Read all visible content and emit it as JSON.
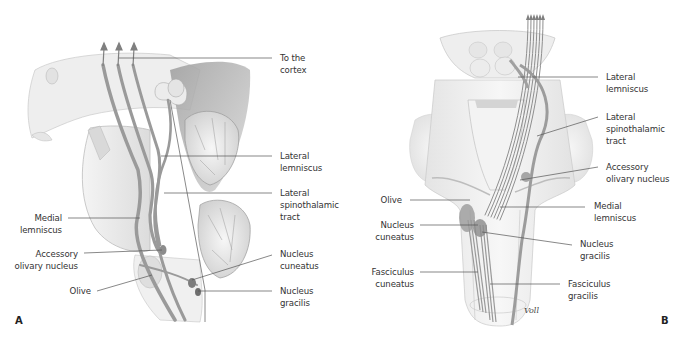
{
  "figure": {
    "panels": [
      {
        "id": "A",
        "letter": "A",
        "labels": {
          "to_cortex": "To the\ncortex",
          "lateral_lemniscus": "Lateral\nlemniscus",
          "lateral_spinothalamic": "Lateral\nspinothalamic\ntract",
          "medial_lemniscus": "Medial\nlemniscus",
          "accessory_olivary": "Accessory\nolivary nucleus",
          "olive": "Olive",
          "nucleus_cuneatus": "Nucleus\ncuneatus",
          "nucleus_gracilis": "Nucleus\ngracilis"
        }
      },
      {
        "id": "B",
        "letter": "B",
        "signature": "Voll",
        "labels": {
          "lateral_lemniscus": "Lateral\nlemniscus",
          "lateral_spinothalamic": "Lateral\nspinothalamic\ntract",
          "accessory_olivary": "Accessory\nolivary nucleus",
          "olive": "Olive",
          "medial_lemniscus": "Medial\nlemniscus",
          "nucleus_cuneatus": "Nucleus\ncuneatus",
          "nucleus_gracilis": "Nucleus\ngracilis",
          "fasciculus_cuneatus": "Fasciculus\ncuneatus",
          "fasciculus_gracilis": "Fasciculus\ngracilis"
        }
      }
    ],
    "colors": {
      "tract": "#9a9a9a",
      "tissue": "#ececec",
      "shadow": "#8c8c8c",
      "leader": "#555555"
    }
  }
}
